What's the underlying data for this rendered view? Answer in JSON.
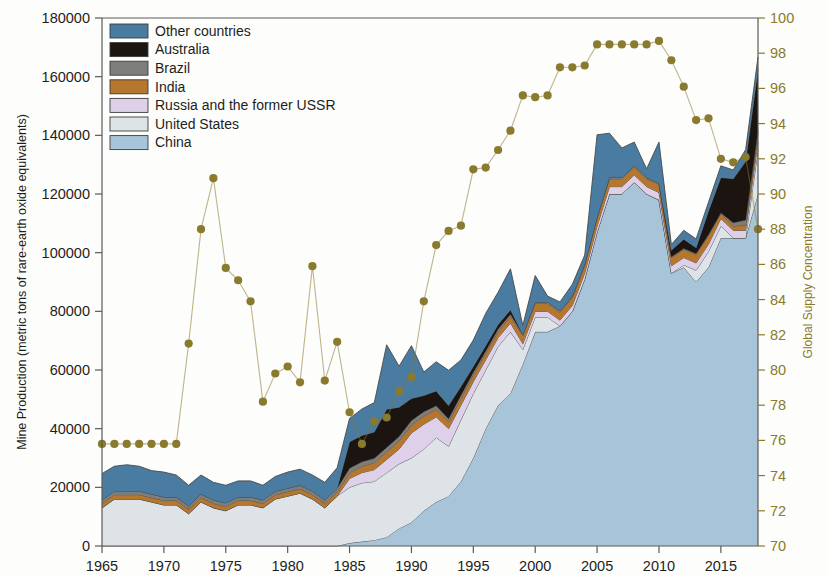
{
  "axes": {
    "left_title": "Mine Production (metric tons of rare-earth oxide equivalents)",
    "right_title": "Global Supply Concentration",
    "left_ticks": [
      "0",
      "20000",
      "40000",
      "60000",
      "80000",
      "100000",
      "120000",
      "140000",
      "160000",
      "180000"
    ],
    "right_ticks": [
      "70",
      "72",
      "74",
      "76",
      "78",
      "80",
      "82",
      "84",
      "86",
      "88",
      "90",
      "92",
      "94",
      "96",
      "98",
      "100"
    ],
    "x_ticks": [
      "1965",
      "1970",
      "1975",
      "1980",
      "1985",
      "1990",
      "1995",
      "2000",
      "2005",
      "2010",
      "2015"
    ]
  },
  "legend": {
    "items": [
      {
        "label": "Other countries",
        "color": "#4a7ba0"
      },
      {
        "label": "Australia",
        "color": "#1c1410"
      },
      {
        "label": "Brazil",
        "color": "#7d7d7b"
      },
      {
        "label": "India",
        "color": "#b5762e"
      },
      {
        "label": "Russia and the former USSR",
        "color": "#ddd0e8"
      },
      {
        "label": "United States",
        "color": "#dde3e6"
      },
      {
        "label": "China",
        "color": "#a8c4d8"
      }
    ]
  },
  "chart_data": {
    "type": "area",
    "title": "",
    "xlabel": "",
    "ylabel": "Mine Production (metric tons of rare-earth oxide equivalents)",
    "y2label": "Global Supply Concentration",
    "xlim": [
      1965,
      2018
    ],
    "ylim": [
      0,
      180000
    ],
    "y2lim": [
      70,
      100
    ],
    "grid": false,
    "legend_position": "top-left",
    "stack_order_bottom_to_top": [
      "China",
      "United States",
      "Russia and the former USSR",
      "India",
      "Brazil",
      "Australia",
      "Other countries"
    ],
    "x": [
      1965,
      1966,
      1967,
      1968,
      1969,
      1970,
      1971,
      1972,
      1973,
      1974,
      1975,
      1976,
      1977,
      1978,
      1979,
      1980,
      1981,
      1982,
      1983,
      1984,
      1985,
      1986,
      1987,
      1988,
      1989,
      1990,
      1991,
      1992,
      1993,
      1994,
      1995,
      1996,
      1997,
      1998,
      1999,
      2000,
      2001,
      2002,
      2003,
      2004,
      2005,
      2006,
      2007,
      2008,
      2009,
      2010,
      2011,
      2012,
      2013,
      2014,
      2015,
      2016,
      2017,
      2018
    ],
    "series": [
      {
        "name": "China",
        "color": "#a8c4d8",
        "values": [
          0,
          0,
          0,
          0,
          0,
          0,
          0,
          0,
          0,
          0,
          0,
          0,
          0,
          0,
          0,
          0,
          0,
          0,
          0,
          0,
          1000,
          1500,
          2000,
          3000,
          6000,
          8000,
          12000,
          15000,
          17000,
          22000,
          30000,
          40000,
          48000,
          52000,
          62000,
          73000,
          73000,
          75000,
          80000,
          91000,
          107000,
          120000,
          120000,
          124000,
          120000,
          118000,
          93000,
          95000,
          90000,
          95000,
          105000,
          105000,
          105000,
          120000
        ]
      },
      {
        "name": "United States",
        "color": "#dde3e6",
        "values": [
          13000,
          16000,
          16000,
          16000,
          15000,
          14000,
          14000,
          11000,
          15000,
          13000,
          12000,
          14000,
          14000,
          13000,
          16000,
          17000,
          18000,
          16000,
          13000,
          17000,
          19000,
          20000,
          20000,
          22000,
          22000,
          22000,
          21000,
          22000,
          17000,
          21000,
          22000,
          20000,
          20000,
          21000,
          5000,
          5000,
          5000,
          0,
          0,
          0,
          0,
          0,
          0,
          0,
          0,
          0,
          0,
          800,
          4000,
          5400,
          4100,
          0,
          0,
          15000
        ]
      },
      {
        "name": "Russia and the former USSR",
        "color": "#ddd0e8",
        "values": [
          0,
          0,
          0,
          0,
          0,
          0,
          0,
          0,
          0,
          0,
          0,
          0,
          0,
          0,
          0,
          0,
          0,
          0,
          0,
          0,
          3000,
          3500,
          4000,
          4500,
          5000,
          8500,
          8500,
          7000,
          6000,
          5000,
          4000,
          3500,
          3000,
          3000,
          2000,
          2000,
          2000,
          2000,
          2000,
          2000,
          2000,
          2500,
          2500,
          2500,
          2500,
          2500,
          2500,
          2500,
          2500,
          2500,
          2500,
          2600,
          2600,
          2600
        ]
      },
      {
        "name": "India",
        "color": "#b5762e",
        "values": [
          1500,
          1500,
          1500,
          1500,
          1500,
          1500,
          1500,
          1500,
          1500,
          1500,
          1500,
          1500,
          1500,
          1500,
          1500,
          1500,
          1500,
          1500,
          1500,
          1500,
          2000,
          2200,
          2400,
          2600,
          2800,
          2800,
          2800,
          2600,
          2400,
          2400,
          2300,
          2200,
          2200,
          2200,
          2700,
          2700,
          2700,
          2700,
          2700,
          2700,
          2700,
          2700,
          2700,
          2700,
          2700,
          2800,
          2800,
          2800,
          2900,
          3000,
          1700,
          1500,
          1800,
          3000
        ]
      },
      {
        "name": "Brazil",
        "color": "#7d7d7b",
        "values": [
          1200,
          1200,
          1200,
          1200,
          1200,
          1200,
          1200,
          1200,
          1200,
          1200,
          1200,
          1200,
          1200,
          1200,
          1200,
          1200,
          1200,
          1200,
          1200,
          1200,
          1500,
          1500,
          1500,
          1500,
          1500,
          1500,
          1500,
          1200,
          1000,
          1000,
          900,
          800,
          800,
          800,
          500,
          500,
          500,
          500,
          500,
          500,
          500,
          500,
          500,
          500,
          400,
          400,
          300,
          300,
          300,
          300,
          300,
          1100,
          1700,
          1100
        ]
      },
      {
        "name": "Australia",
        "color": "#1c1410",
        "values": [
          0,
          0,
          0,
          0,
          0,
          0,
          0,
          0,
          0,
          0,
          0,
          0,
          0,
          0,
          0,
          0,
          0,
          0,
          0,
          0,
          9000,
          9000,
          9000,
          13000,
          10000,
          7500,
          5500,
          5000,
          4500,
          3000,
          2000,
          1800,
          1500,
          1500,
          0,
          0,
          0,
          0,
          0,
          0,
          0,
          0,
          0,
          0,
          0,
          0,
          2200,
          3200,
          2000,
          8000,
          12000,
          15000,
          20000,
          21000
        ]
      },
      {
        "name": "Other countries",
        "color": "#4a7ba0",
        "values": [
          9000,
          8500,
          9000,
          8500,
          8000,
          8500,
          7500,
          7000,
          6500,
          6000,
          6000,
          5500,
          5500,
          5000,
          5000,
          5500,
          5500,
          5500,
          6000,
          7000,
          8000,
          9000,
          10000,
          22000,
          14000,
          18000,
          8000,
          10000,
          12000,
          9000,
          9000,
          11000,
          11000,
          14000,
          3000,
          9000,
          2000,
          3000,
          4000,
          3000,
          28000,
          15000,
          10000,
          8000,
          3000,
          14000,
          2000,
          3000,
          3000,
          3000,
          4000,
          3000,
          4000,
          4000
        ]
      }
    ],
    "supply_concentration": {
      "name": "Global Supply Concentration",
      "color": "#8a7a2e",
      "style": "dotted-marker-line",
      "x": [
        1965,
        1966,
        1967,
        1968,
        1969,
        1970,
        1971,
        1972,
        1973,
        1974,
        1975,
        1976,
        1977,
        1978,
        1979,
        1980,
        1981,
        1982,
        1983,
        1984,
        1985,
        1986,
        1987,
        1988,
        1989,
        1990,
        1991,
        1992,
        1993,
        1994,
        1995,
        1996,
        1997,
        1998,
        1999,
        2000,
        2001,
        2002,
        2003,
        2004,
        2005,
        2006,
        2007,
        2008,
        2009,
        2010,
        2011,
        2012,
        2013,
        2014,
        2015,
        2016,
        2017,
        2018
      ],
      "values": [
        75.8,
        75.8,
        75.8,
        75.8,
        75.8,
        75.8,
        75.8,
        81.5,
        88.0,
        90.9,
        85.8,
        85.1,
        83.9,
        78.2,
        79.8,
        80.2,
        79.3,
        85.9,
        79.4,
        81.6,
        77.6,
        75.8,
        77.1,
        77.3,
        78.8,
        79.6,
        83.9,
        87.1,
        87.9,
        88.2,
        91.4,
        91.5,
        92.5,
        93.6,
        95.6,
        95.5,
        95.6,
        97.2,
        97.2,
        97.3,
        98.5,
        98.5,
        98.5,
        98.5,
        98.5,
        98.7,
        97.6,
        96.1,
        94.2,
        94.3,
        92.0,
        91.8,
        92.1,
        88.0
      ]
    }
  }
}
